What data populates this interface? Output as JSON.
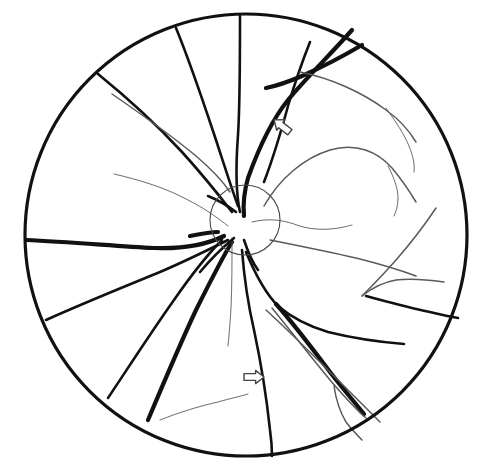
{
  "figure": {
    "type": "line-drawing",
    "background_color": "#ffffff",
    "ink_color": "#111111",
    "faint_ink_color": "#5a5a5a",
    "canvas": {
      "width": 490,
      "height": 474
    }
  },
  "fundus_outline": {
    "name": "fundus-boundary-circle",
    "shape": "circle",
    "center_x": 246,
    "center_y": 235,
    "radius": 221,
    "stroke_width": 3.2,
    "color": "#111111"
  },
  "optic_disc": {
    "name": "optic-disc-circle",
    "shape": "circle",
    "center_x": 245,
    "center_y": 220,
    "radius": 35,
    "stroke_width": 1.1,
    "color": "#4a4a4a"
  },
  "annotations": {
    "arrows": [
      {
        "id": "arrow-upper",
        "label": "upper-annotation-arrow",
        "direction": "up-left",
        "tip_x": 272,
        "tip_y": 118,
        "center_x": 282,
        "center_y": 126,
        "size": 20,
        "rotation_deg": 218,
        "style": "hollow-outline",
        "stroke_color": "#444444",
        "fill_color": "#ffffff",
        "stroke_width": 1.4
      },
      {
        "id": "arrow-lower",
        "label": "lower-annotation-arrow",
        "direction": "right",
        "tip_x": 266,
        "tip_y": 377,
        "center_x": 254,
        "center_y": 377,
        "size": 20,
        "rotation_deg": 0,
        "style": "hollow-outline",
        "stroke_color": "#444444",
        "fill_color": "#ffffff",
        "stroke_width": 1.4
      }
    ]
  },
  "vessels": {
    "thick_stroke": 4.2,
    "medium_stroke": 2.6,
    "thin_stroke": 1.5,
    "hair_stroke": 0.9,
    "paths": [
      {
        "id": "v-superior-vertical",
        "name": "superior-vertical-vessel",
        "weight": "medium",
        "d": "M240,16 C240,60 240,105 238,135 C236,162 235,190 240,212"
      },
      {
        "id": "v-superotemporal-main",
        "name": "superotemporal-main-arcade",
        "weight": "thick",
        "d": "M352,30 C330,55 306,78 288,100 C272,120 258,150 248,178 C244,192 243,205 244,216"
      },
      {
        "id": "v-superotemporal-branch",
        "name": "superotemporal-upper-branch",
        "weight": "medium",
        "d": "M310,42 C302,62 294,86 288,106 C282,128 274,156 264,182"
      },
      {
        "id": "v-super-right-sweep",
        "name": "superior-right-sweep-vessel",
        "weight": "thick",
        "d": "M362,45 C340,58 320,68 302,76 C288,82 276,86 266,88"
      },
      {
        "id": "v-super-right-thin",
        "name": "superior-right-thin-branch",
        "weight": "thin",
        "d": "M300,72 C330,78 362,92 386,110 C400,120 410,132 416,142"
      },
      {
        "id": "v-super-right-hair",
        "name": "superior-right-hair-branch",
        "weight": "hair",
        "d": "M386,108 C396,122 404,134 409,146 C413,156 415,164 414,172"
      },
      {
        "id": "v-superonasal-1",
        "name": "superonasal-vessel-one",
        "weight": "medium",
        "d": "M176,28 C190,62 202,98 214,134 C222,158 230,184 238,206"
      },
      {
        "id": "v-superonasal-2",
        "name": "superonasal-vessel-two",
        "weight": "medium",
        "d": "M98,74 C130,100 158,126 182,152 C202,174 218,194 232,212"
      },
      {
        "id": "v-superonasal-2-branch",
        "name": "superonasal-branch-thin",
        "weight": "thin",
        "d": "M112,94 C144,116 172,136 196,156 C210,168 222,180 230,192"
      },
      {
        "id": "v-nasal-thin-arc",
        "name": "nasal-thin-arcing-vessel",
        "weight": "hair",
        "d": "M114,174 C140,180 166,188 188,200 C204,208 218,218 228,226"
      },
      {
        "id": "v-nasal-main",
        "name": "nasal-horizontal-main-vessel",
        "weight": "thick",
        "d": "M26,240 C70,242 116,246 154,248 C184,249 208,244 224,236"
      },
      {
        "id": "v-nasal-stub",
        "name": "nasal-short-stub",
        "weight": "thick",
        "d": "M190,236 C200,234 210,232 218,232"
      },
      {
        "id": "v-inferonasal-1",
        "name": "inferonasal-vessel-one",
        "weight": "medium",
        "d": "M46,320 C86,302 126,286 160,272 C188,260 212,248 228,240"
      },
      {
        "id": "v-inferonasal-2",
        "name": "inferonasal-vessel-two",
        "weight": "medium",
        "d": "M108,398 C132,362 154,328 174,300 C192,274 208,254 222,240"
      },
      {
        "id": "v-inferior-main",
        "name": "inferior-main-arcade",
        "weight": "thick",
        "d": "M148,420 C164,382 180,344 196,310 C210,282 222,258 232,242"
      },
      {
        "id": "v-inferior-central",
        "name": "inferior-central-vessel",
        "weight": "medium",
        "d": "M242,250 C244,276 248,304 254,330 C260,358 266,392 270,430 C272,444 272,452 272,456"
      },
      {
        "id": "v-inferior-central-hair",
        "name": "inferior-central-faint-vessel",
        "weight": "hair",
        "d": "M232,238 C232,262 232,286 231,308 C230,324 229,336 228,346"
      },
      {
        "id": "v-inferotemporal-main",
        "name": "inferotemporal-main-arcade",
        "weight": "medium",
        "d": "M246,252 C256,276 266,294 278,306 C292,318 308,326 328,332 C352,338 380,342 404,344"
      },
      {
        "id": "v-inferotemporal-thick",
        "name": "inferotemporal-thick-descending-vessel",
        "weight": "thick",
        "d": "M276,304 C294,324 312,348 330,372 C344,390 356,404 364,414"
      },
      {
        "id": "v-inferotemporal-parallel",
        "name": "inferotemporal-parallel-vessel",
        "weight": "thin",
        "d": "M272,308 C290,330 310,356 330,380 C344,396 356,410 366,418"
      },
      {
        "id": "v-inferotemporal-loop",
        "name": "inferotemporal-lower-loop",
        "weight": "thin",
        "d": "M334,386 C336,400 340,412 346,422 C352,430 358,436 362,440"
      },
      {
        "id": "v-inferotemporal-fork",
        "name": "inferotemporal-fork-vessel",
        "weight": "thin",
        "d": "M266,310 C288,330 314,356 340,382 C356,398 370,412 380,422"
      },
      {
        "id": "v-temporal-upper-arcade",
        "name": "temporal-upper-arcade-macular",
        "weight": "thin",
        "d": "M264,206 C280,178 304,158 330,150 C356,142 378,152 392,168 C402,180 410,192 416,202"
      },
      {
        "id": "v-temporal-arcade-hair",
        "name": "temporal-arcade-faint-tail",
        "weight": "hair",
        "d": "M388,166 C394,178 398,188 398,198 C398,206 396,212 394,216"
      },
      {
        "id": "v-temporal-mid",
        "name": "temporal-midline-thin-vessel",
        "weight": "hair",
        "d": "M252,222 C268,218 282,220 294,224 C304,228 316,230 330,229 C342,228 348,226 352,225"
      },
      {
        "id": "v-temporal-far",
        "name": "temporal-far-thin-vessel",
        "weight": "thin",
        "d": "M270,240 C300,246 330,252 356,258 C380,264 400,270 416,276"
      },
      {
        "id": "v-temporal-far-upper",
        "name": "temporal-upper-right-diagonal",
        "weight": "thin",
        "d": "M436,208 C424,226 410,244 396,260 C382,276 370,288 362,296"
      },
      {
        "id": "v-temporal-right-lower",
        "name": "temporal-right-lower-branch",
        "weight": "medium",
        "d": "M366,296 C380,300 396,304 412,308 C430,312 446,316 458,318"
      },
      {
        "id": "v-temporal-right-join",
        "name": "temporal-right-join-vessel",
        "weight": "thin",
        "d": "M362,296 C372,288 384,282 396,280 C412,278 430,280 444,282"
      },
      {
        "id": "v-inferonasal-thin-tail",
        "name": "inferonasal-thin-tail-vessel",
        "weight": "hair",
        "d": "M160,420 C180,412 200,406 218,402 C232,398 242,396 248,394"
      },
      {
        "id": "v-disc-branch-a",
        "name": "disc-branch-upper-left",
        "weight": "medium",
        "d": "M236,212 C228,206 218,200 208,196"
      },
      {
        "id": "v-disc-branch-b",
        "name": "disc-branch-lower-left",
        "weight": "medium",
        "d": "M234,238 C222,248 210,260 200,272"
      },
      {
        "id": "v-disc-branch-c",
        "name": "disc-branch-lower-right",
        "weight": "medium",
        "d": "M244,240 C248,252 252,262 258,270"
      }
    ]
  }
}
